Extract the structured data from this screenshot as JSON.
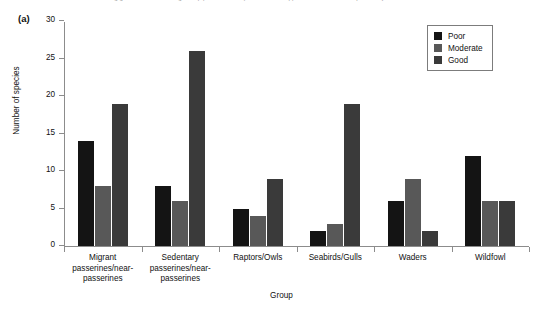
{
  "caption": {
    "text": "…g  g……  …  …………  …g… …   p  p…… …… … (… …  … … …  appendix … for further explanation)"
  },
  "panel": {
    "label": "(a)"
  },
  "legend": {
    "position": "top-right",
    "entries": [
      {
        "label": "Poor",
        "color": "#141414"
      },
      {
        "label": "Moderate",
        "color": "#585858"
      },
      {
        "label": "Good",
        "color": "#3a3a3a"
      }
    ]
  },
  "chart_data": {
    "type": "bar",
    "title": "",
    "xlabel": "Group",
    "ylabel": "Number of species",
    "ylim": [
      0,
      30
    ],
    "yticks": [
      0,
      5,
      10,
      15,
      20,
      25,
      30
    ],
    "grid": false,
    "categories": [
      "Migrant passerines/near-passerines",
      "Sedentary passerines/near-passerines",
      "Raptors/Owls",
      "Seabirds/Gulls",
      "Waders",
      "Wildfowl"
    ],
    "category_lines": [
      [
        "Migrant",
        "passerines/near-",
        "passerines"
      ],
      [
        "Sedentary",
        "passerines/near-",
        "passerines"
      ],
      [
        "Raptors/Owls"
      ],
      [
        "Seabirds/Gulls"
      ],
      [
        "Waders"
      ],
      [
        "Wildfowl"
      ]
    ],
    "series": [
      {
        "name": "Poor",
        "color": "#141414",
        "values": [
          14,
          8,
          5,
          2,
          6,
          12
        ]
      },
      {
        "name": "Moderate",
        "color": "#585858",
        "values": [
          8,
          6,
          4,
          3,
          9,
          6
        ]
      },
      {
        "name": "Good",
        "color": "#3a3a3a",
        "values": [
          19,
          26,
          9,
          19,
          2,
          6
        ]
      }
    ]
  }
}
